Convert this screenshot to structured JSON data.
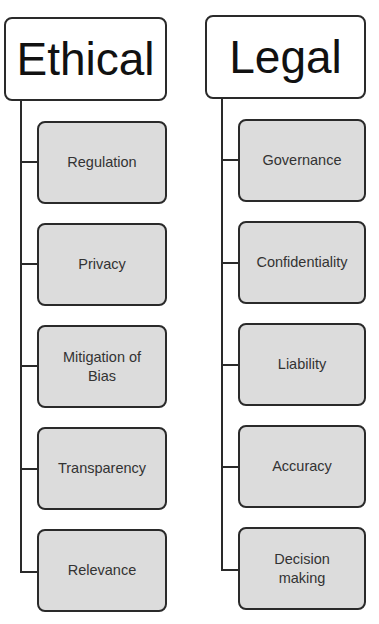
{
  "diagram": {
    "type": "hierarchy",
    "colors": {
      "header_fill": "#ffffff",
      "child_fill": "#dcdcdc",
      "stroke": "#2a2a2a",
      "text": "#333333"
    },
    "columns": [
      {
        "title": "Ethical",
        "items": [
          {
            "label": "Regulation"
          },
          {
            "label": "Privacy"
          },
          {
            "label": "Mitigation of Bias"
          },
          {
            "label": "Transparency"
          },
          {
            "label": "Relevance"
          }
        ]
      },
      {
        "title": "Legal",
        "items": [
          {
            "label": "Governance"
          },
          {
            "label": "Confidentiality"
          },
          {
            "label": "Liability"
          },
          {
            "label": "Accuracy"
          },
          {
            "label": "Decision making"
          }
        ]
      }
    ]
  }
}
